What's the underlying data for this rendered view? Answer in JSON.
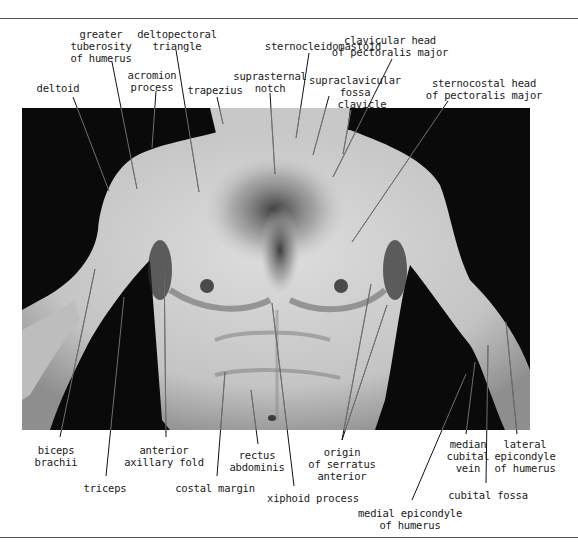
{
  "figure": {
    "photo": {
      "x": 22,
      "y": 108,
      "w": 508,
      "h": 322,
      "background": "#0a0a0a",
      "skin": "#cfcfcf"
    },
    "rule_color": "#555555",
    "leader_color": "#111111"
  },
  "labels": [
    {
      "id": "greater-tuberosity",
      "text": "greater\ntuberosity\nof humerus",
      "x": 101,
      "y": 28,
      "line": [
        112,
        62,
        137,
        189
      ]
    },
    {
      "id": "deltopectoral-triangle",
      "text": "deltopectoral\ntriangle",
      "x": 177,
      "y": 28,
      "line": [
        176,
        50,
        199,
        192
      ]
    },
    {
      "id": "acromion-process",
      "text": "acromion\nprocess",
      "x": 152,
      "y": 69,
      "line": [
        156,
        91,
        152,
        148
      ]
    },
    {
      "id": "deltoid",
      "text": "deltoid",
      "x": 58,
      "y": 82,
      "line": [
        73,
        97,
        109,
        191
      ]
    },
    {
      "id": "trapezius",
      "text": "trapezius",
      "x": 215,
      "y": 84,
      "line": [
        217,
        97,
        223,
        124
      ]
    },
    {
      "id": "sternocleidomastoid",
      "text": "sternocleidomastoid",
      "x": 323,
      "y": 40,
      "line": [
        309,
        53,
        296,
        138
      ]
    },
    {
      "id": "suprasternal-notch",
      "text": "suprasternal\nnotch",
      "x": 270,
      "y": 70,
      "line": [
        270,
        93,
        275,
        174
      ]
    },
    {
      "id": "clavicular-head-pectoralis",
      "text": "clavicular head\nof pectoralis major",
      "x": 390,
      "y": 34,
      "line": [
        392,
        59,
        333,
        177
      ]
    },
    {
      "id": "supraclavicular-fossa",
      "text": "supraclavicular\nfossa",
      "x": 355,
      "y": 74,
      "line": [
        329,
        96,
        313,
        155
      ]
    },
    {
      "id": "clavicle",
      "text": "clavicle",
      "x": 362,
      "y": 98,
      "line": [
        351,
        110,
        343,
        154
      ]
    },
    {
      "id": "sternocostal-head-pectoralis",
      "text": "sternocostal head\nof pectoralis major",
      "x": 484,
      "y": 77,
      "line": [
        448,
        101,
        352,
        242
      ]
    },
    {
      "id": "biceps-brachii",
      "text": "biceps\nbrachii",
      "x": 56,
      "y": 444,
      "line": [
        60,
        437,
        95,
        269
      ]
    },
    {
      "id": "triceps",
      "text": "triceps",
      "x": 105,
      "y": 482,
      "line": [
        106,
        476,
        124,
        297
      ]
    },
    {
      "id": "anterior-axillary-fold",
      "text": "anterior\naxillary fold",
      "x": 164,
      "y": 444,
      "line": [
        166,
        437,
        164,
        254
      ]
    },
    {
      "id": "costal-margin",
      "text": "costal margin",
      "x": 215,
      "y": 482,
      "line": [
        217,
        476,
        225,
        372
      ]
    },
    {
      "id": "rectus-abdominis",
      "text": "rectus\nabdominis",
      "x": 257,
      "y": 449,
      "line": [
        258,
        444,
        251,
        390
      ]
    },
    {
      "id": "xiphoid-process",
      "text": "xiphoid process",
      "x": 313,
      "y": 492,
      "line": [
        294,
        486,
        272,
        303
      ]
    },
    {
      "id": "origin-serratus-anterior",
      "text": "origin\nof serratus\nanterior",
      "x": 342,
      "y": 446,
      "line": [
        342,
        440,
        371,
        284
      ],
      "line2": [
        342,
        440,
        387,
        305
      ]
    },
    {
      "id": "medial-epicondyle",
      "text": "medial epicondyle\nof humerus",
      "x": 410,
      "y": 507,
      "line": [
        412,
        500,
        466,
        374
      ]
    },
    {
      "id": "median-cubital-vein",
      "text": "median\ncubital\nvein",
      "x": 468,
      "y": 438,
      "line": [
        466,
        434,
        475,
        362
      ]
    },
    {
      "id": "cubital-fossa",
      "text": "cubital fossa",
      "x": 488,
      "y": 489,
      "line": [
        486,
        483,
        488,
        345
      ]
    },
    {
      "id": "lateral-epicondyle",
      "text": "lateral\nepicondyle\nof humerus",
      "x": 525,
      "y": 438,
      "line": [
        517,
        434,
        506,
        322
      ]
    }
  ]
}
